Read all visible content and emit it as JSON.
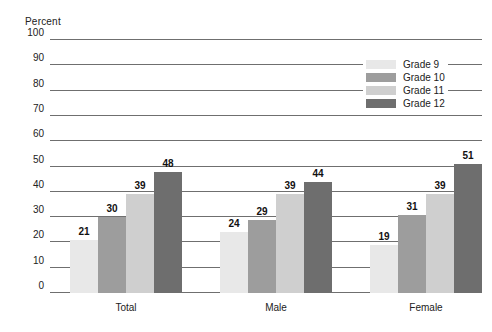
{
  "chart_data": {
    "type": "bar",
    "title": "",
    "subtitle": "",
    "xlabel": "",
    "ylabel": "Percent",
    "ylim": [
      0,
      100
    ],
    "ytick_step": 10,
    "yticks": [
      "100",
      "90",
      "80",
      "70",
      "60",
      "50",
      "40",
      "30",
      "20",
      "10",
      "0"
    ],
    "grid": true,
    "legend_position": "top-right",
    "categories": [
      "Total",
      "Male",
      "Female"
    ],
    "series": [
      {
        "name": "Grade 9",
        "color": "#e8e8e8",
        "values": [
          21,
          24,
          19
        ]
      },
      {
        "name": "Grade 10",
        "color": "#9d9d9d",
        "values": [
          30,
          29,
          31
        ]
      },
      {
        "name": "Grade 11",
        "color": "#cfcfcf",
        "values": [
          39,
          39,
          39
        ]
      },
      {
        "name": "Grade 12",
        "color": "#6e6e6e",
        "values": [
          48,
          44,
          51
        ]
      }
    ],
    "data_labels": [
      [
        "21",
        "30",
        "39",
        "48"
      ],
      [
        "24",
        "29",
        "39",
        "44"
      ],
      [
        "19",
        "31",
        "39",
        "51"
      ]
    ],
    "axis_color": "#6f6f6f"
  }
}
